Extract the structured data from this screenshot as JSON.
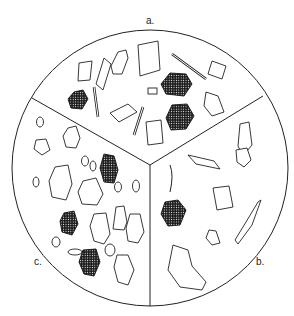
{
  "figure": {
    "type": "sectored-circle illustration of particle types",
    "sectors": [
      {
        "id": "a",
        "label": "a.",
        "content": "crystalline particles: hexagonal plates, laths, rods, rectangular tablets (some dark/stippled hexagons)"
      },
      {
        "id": "b",
        "label": "b.",
        "content": "mixed angular fragments, one dark stippled particle, elongated shard, large plate"
      },
      {
        "id": "c",
        "label": "c.",
        "content": "rounded/irregular grains, several dark stippled grains, small ovoid particles"
      }
    ]
  }
}
